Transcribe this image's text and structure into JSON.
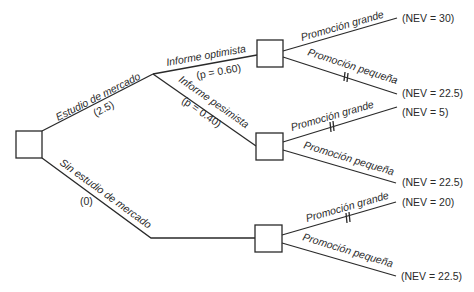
{
  "diagram": {
    "type": "decision-tree",
    "root": {
      "branches": [
        {
          "label": "Estudio de mercado",
          "cost": "(2.5)",
          "chance_branches": [
            {
              "label": "Informe optimista",
              "prob": "(p = 0.60)",
              "options": [
                {
                  "label": "Promoción grande",
                  "nev": "(NEV = 30)",
                  "pruned": false
                },
                {
                  "label": "Promoción pequeña",
                  "nev": "(NEV = 22.5)",
                  "pruned": true
                }
              ]
            },
            {
              "label": "Informe pesimista",
              "prob": "(p = 0.40)",
              "options": [
                {
                  "label": "Promoción grande",
                  "nev": "(NEV = 5)",
                  "pruned": true
                },
                {
                  "label": "Promoción pequeña",
                  "nev": "(NEV = 22.5)",
                  "pruned": false
                }
              ]
            }
          ]
        },
        {
          "label": "Sin estudio de mercado",
          "cost": "(0)",
          "options": [
            {
              "label": "Promoción grande",
              "nev": "(NEV = 20)",
              "pruned": true
            },
            {
              "label": "Promoción pequeña",
              "nev": "(NEV = 22.5)",
              "pruned": false
            }
          ]
        }
      ]
    }
  }
}
